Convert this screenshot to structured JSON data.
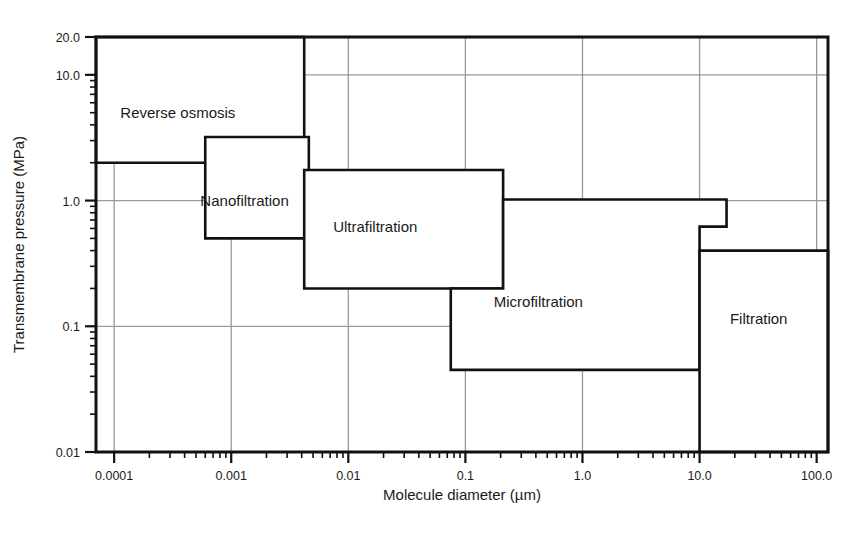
{
  "chart_data": {
    "type": "diagram",
    "title": "",
    "xlabel": "Molecule diameter (µm)",
    "ylabel": "Transmembrane pressure (MPa)",
    "xscale": "log",
    "yscale": "log",
    "xlim": [
      7e-05,
      125.0
    ],
    "ylim": [
      0.01,
      20.0
    ],
    "grid": true,
    "xticks": [
      0.0001,
      0.001,
      0.01,
      0.1,
      1.0,
      10.0,
      100.0
    ],
    "xticklabels": [
      "0.0001",
      "0.001",
      "0.01",
      "0.1",
      "1.0",
      "10.0",
      "100.0"
    ],
    "yticks": [
      0.01,
      0.1,
      1.0,
      10.0,
      20.0
    ],
    "yticklabels": [
      "0.01",
      "0.1",
      "1.0",
      "10.0",
      "20.0"
    ],
    "regions": [
      {
        "name": "Reverse osmosis",
        "label": "Reverse osmosis",
        "label_x": 0.00035,
        "label_y": 5.0,
        "polygon": [
          [
            7e-05,
            2.0
          ],
          [
            0.0042,
            2.0
          ],
          [
            0.0042,
            20.0
          ],
          [
            7e-05,
            20.0
          ]
        ]
      },
      {
        "name": "Nanofiltration",
        "label": "Nanofiltration",
        "label_x": 0.0013,
        "label_y": 1.0,
        "polygon": [
          [
            0.0006,
            0.5
          ],
          [
            0.0046,
            0.5
          ],
          [
            0.0046,
            3.2
          ],
          [
            0.0006,
            3.2
          ]
        ]
      },
      {
        "name": "Ultrafiltration",
        "label": "Ultrafiltration",
        "label_x": 0.017,
        "label_y": 0.62,
        "polygon": [
          [
            0.0042,
            0.2
          ],
          [
            0.21,
            0.2
          ],
          [
            0.21,
            1.75
          ],
          [
            0.0042,
            1.75
          ]
        ]
      },
      {
        "name": "Microfiltration",
        "label": "Microfiltration",
        "label_x": 0.42,
        "label_y": 0.155,
        "polygon": [
          [
            0.075,
            0.045
          ],
          [
            10.0,
            0.045
          ],
          [
            10.0,
            0.62
          ],
          [
            17.0,
            0.62
          ],
          [
            17.0,
            1.02
          ],
          [
            0.21,
            1.02
          ],
          [
            0.21,
            0.2
          ],
          [
            0.075,
            0.2
          ]
        ]
      },
      {
        "name": "Filtration",
        "label": "Filtration",
        "label_x": 32.0,
        "label_y": 0.115,
        "polygon": [
          [
            10.0,
            0.01
          ],
          [
            125.0,
            0.01
          ],
          [
            125.0,
            0.4
          ],
          [
            10.0,
            0.4
          ]
        ]
      }
    ],
    "colors": {
      "frame": "#111111",
      "grid": "#9a9a9a",
      "region_outline": "#111111",
      "text": "#1a1a1a",
      "background": "#ffffff"
    }
  }
}
